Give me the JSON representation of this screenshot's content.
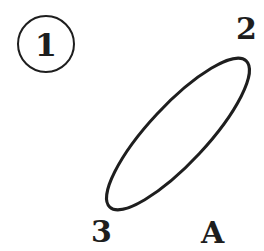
{
  "figure": {
    "number_badge": "1",
    "point_labels": {
      "top_right": "2",
      "bottom_left": "3"
    },
    "panel_label": "A",
    "shape": {
      "type": "ellipse",
      "stroke_color": "#1e1e1e",
      "fill": "none"
    }
  },
  "colors": {
    "ink": "#1e1e1e",
    "background": "#ffffff"
  }
}
